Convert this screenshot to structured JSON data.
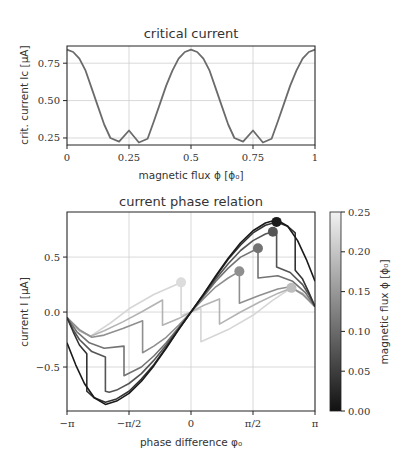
{
  "figure": {
    "background": "#ffffff",
    "axis_color": "#222222",
    "grid_color": "#cfcfcf"
  },
  "chart_data": [
    {
      "id": "critical-current",
      "type": "line",
      "title": "critical current",
      "xlabel": "magnetic flux ϕ [ϕ₀]",
      "ylabel": "crit. current Iᴄ [μA]",
      "xlim": [
        0,
        1
      ],
      "ylim": [
        0.203,
        0.865
      ],
      "grid": true,
      "xticks": [
        0,
        0.25,
        0.5,
        0.75,
        1
      ],
      "xtick_labels": [
        "0",
        "0.25",
        "0.5",
        "0.75",
        "1"
      ],
      "yticks": [
        0.25,
        0.5,
        0.75
      ],
      "ytick_labels": [
        "0.25",
        "0.50",
        "0.75"
      ],
      "line_color": "#6b6b6b",
      "series": [
        {
          "name": "Ic",
          "x": [
            0,
            0.025,
            0.05,
            0.075,
            0.1,
            0.125,
            0.15,
            0.175,
            0.21,
            0.25,
            0.29,
            0.325,
            0.35,
            0.375,
            0.4,
            0.425,
            0.45,
            0.475,
            0.5,
            0.525,
            0.55,
            0.575,
            0.6,
            0.625,
            0.65,
            0.675,
            0.71,
            0.75,
            0.79,
            0.825,
            0.85,
            0.875,
            0.9,
            0.925,
            0.95,
            0.975,
            1
          ],
          "y": [
            0.84,
            0.825,
            0.78,
            0.7,
            0.58,
            0.46,
            0.34,
            0.25,
            0.225,
            0.3,
            0.22,
            0.245,
            0.36,
            0.48,
            0.6,
            0.7,
            0.78,
            0.825,
            0.84,
            0.825,
            0.78,
            0.7,
            0.58,
            0.46,
            0.34,
            0.25,
            0.225,
            0.3,
            0.22,
            0.245,
            0.36,
            0.48,
            0.6,
            0.7,
            0.78,
            0.825,
            0.84
          ]
        }
      ]
    },
    {
      "id": "current-phase-relation",
      "type": "line",
      "title": "current phase relation",
      "xlabel": "phase difference φ₀",
      "ylabel": "current I [μA]",
      "xlim_pi": [
        -1,
        1
      ],
      "ylim": [
        -0.9,
        0.91
      ],
      "grid": true,
      "xticks_pi": [
        -1,
        -0.5,
        0,
        0.5,
        1
      ],
      "xtick_labels": [
        "−π",
        "−π/2",
        "0",
        "π/2",
        "π"
      ],
      "yticks": [
        -0.5,
        0.0,
        0.5
      ],
      "ytick_labels": [
        "−0.5",
        "0.0",
        "0.5"
      ],
      "note": "x values in units of π; curves are odd-symmetric (left half = mirror of right half)",
      "series": [
        {
          "flux": 0.0,
          "color": "#1a1a1a",
          "right_half": [
            [
              0,
              0
            ],
            [
              0.1,
              0.16
            ],
            [
              0.2,
              0.33
            ],
            [
              0.3,
              0.49
            ],
            [
              0.4,
              0.63
            ],
            [
              0.5,
              0.74
            ],
            [
              0.6,
              0.81
            ],
            [
              0.69,
              0.84
            ],
            [
              0.78,
              0.78
            ],
            [
              0.86,
              0.65
            ],
            [
              0.93,
              0.48
            ],
            [
              1,
              0.28
            ]
          ]
        },
        {
          "flux": 0.02,
          "color": "#333333",
          "right_half": [
            [
              0,
              0
            ],
            [
              0.1,
              0.16
            ],
            [
              0.2,
              0.32
            ],
            [
              0.3,
              0.48
            ],
            [
              0.4,
              0.61
            ],
            [
              0.5,
              0.72
            ],
            [
              0.6,
              0.79
            ],
            [
              0.69,
              0.82
            ],
            [
              0.78,
              0.78
            ],
            [
              0.84,
              0.72
            ],
            [
              0.84,
              0.38
            ],
            [
              0.9,
              0.3
            ],
            [
              0.95,
              0.18
            ],
            [
              1,
              0.05
            ]
          ]
        },
        {
          "flux": 0.05,
          "color": "#555555",
          "right_half": [
            [
              0,
              0
            ],
            [
              0.1,
              0.15
            ],
            [
              0.2,
              0.3
            ],
            [
              0.3,
              0.44
            ],
            [
              0.4,
              0.56
            ],
            [
              0.5,
              0.65
            ],
            [
              0.6,
              0.71
            ],
            [
              0.66,
              0.73
            ],
            [
              0.69,
              0.72
            ],
            [
              0.69,
              0.41
            ],
            [
              0.8,
              0.36
            ],
            [
              0.9,
              0.25
            ],
            [
              0.95,
              0.16
            ],
            [
              1,
              0.05
            ]
          ]
        },
        {
          "flux": 0.1,
          "color": "#737373",
          "right_half": [
            [
              0,
              0
            ],
            [
              0.1,
              0.14
            ],
            [
              0.2,
              0.28
            ],
            [
              0.3,
              0.4
            ],
            [
              0.4,
              0.5
            ],
            [
              0.54,
              0.58
            ],
            [
              0.54,
              0.31
            ],
            [
              0.7,
              0.33
            ],
            [
              0.82,
              0.28
            ],
            [
              0.92,
              0.18
            ],
            [
              1,
              0.05
            ]
          ]
        },
        {
          "flux": 0.15,
          "color": "#8f8f8f",
          "right_half": [
            [
              0,
              0
            ],
            [
              0.1,
              0.12
            ],
            [
              0.2,
              0.23
            ],
            [
              0.3,
              0.31
            ],
            [
              0.39,
              0.37
            ],
            [
              0.39,
              0.08
            ],
            [
              0.55,
              0.15
            ],
            [
              0.7,
              0.21
            ],
            [
              0.8,
              0.23
            ],
            [
              0.9,
              0.16
            ],
            [
              1,
              0.05
            ]
          ]
        },
        {
          "flux": 0.2,
          "color": "#b3b3b3",
          "right_half": [
            [
              0,
              0
            ],
            [
              0.1,
              0.06
            ],
            [
              0.23,
              0.12
            ],
            [
              0.23,
              -0.11
            ],
            [
              0.4,
              0.0
            ],
            [
              0.55,
              0.09
            ],
            [
              0.7,
              0.17
            ],
            [
              0.81,
              0.22
            ],
            [
              0.9,
              0.17
            ],
            [
              1,
              0.05
            ]
          ]
        },
        {
          "flux": 0.25,
          "color": "#d6d6d6",
          "right_half": [
            [
              0,
              0
            ],
            [
              0.08,
              0.03
            ],
            [
              0.08,
              -0.27
            ],
            [
              0.3,
              -0.16
            ],
            [
              0.5,
              -0.03
            ],
            [
              0.65,
              0.1
            ],
            [
              0.81,
              0.22
            ],
            [
              0.9,
              0.17
            ],
            [
              1,
              0.05
            ]
          ]
        }
      ],
      "markers": [
        {
          "flux": 0.0,
          "x_pi": 0.69,
          "y": 0.82,
          "color": "#1a1a1a"
        },
        {
          "flux": 0.05,
          "x_pi": 0.66,
          "y": 0.73,
          "color": "#555555"
        },
        {
          "flux": 0.1,
          "x_pi": 0.54,
          "y": 0.58,
          "color": "#737373"
        },
        {
          "flux": 0.15,
          "x_pi": 0.39,
          "y": 0.37,
          "color": "#8f8f8f"
        },
        {
          "flux": 0.2,
          "x_pi": 0.81,
          "y": 0.22,
          "color": "#bdbdbd"
        },
        {
          "flux": 0.25,
          "x_pi": -0.08,
          "y": 0.27,
          "color": "#dcdcdc"
        }
      ],
      "colorbar": {
        "label": "magnetic flux ϕ [ϕ₀]",
        "range": [
          0.0,
          0.25
        ],
        "ticks": [
          0.0,
          0.05,
          0.1,
          0.15,
          0.2,
          0.25
        ],
        "tick_labels": [
          "0.00",
          "0.05",
          "0.10",
          "0.15",
          "0.20",
          "0.25"
        ],
        "color_low": "#111111",
        "color_high": "#f2f2f2"
      }
    }
  ]
}
